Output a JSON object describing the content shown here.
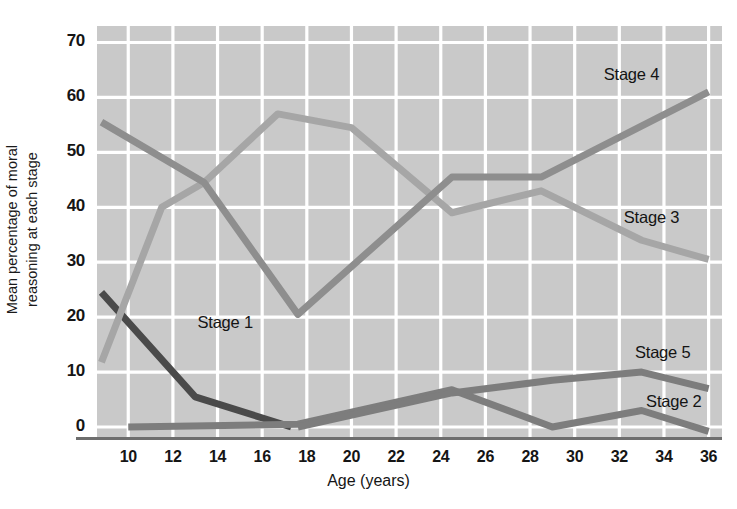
{
  "chart_data": {
    "type": "line",
    "title": "",
    "xlabel": "Age (years)",
    "ylabel": "Mean percentage of moral reasoning at each stage",
    "ylabel_line1": "Mean percentage of moral",
    "ylabel_line2": "reasoning at each stage",
    "xlim": [
      8.6,
      36.6
    ],
    "ylim": [
      -2,
      73
    ],
    "xticks": [
      10,
      12,
      14,
      16,
      18,
      20,
      22,
      24,
      26,
      28,
      30,
      32,
      34,
      36
    ],
    "yticks": [
      0,
      10,
      20,
      30,
      40,
      50,
      60,
      70
    ],
    "grid": true,
    "grid_color": "#ffffff",
    "plot_background": "#c9c9c9",
    "legend_position": "inline-right",
    "series": [
      {
        "name": "Stage 1",
        "color": "#4a4a4a",
        "label_x": 13.1,
        "label_y": 19.0,
        "x": [
          8.8,
          13.0,
          17.3
        ],
        "values": [
          24.5,
          5.5,
          0.0
        ]
      },
      {
        "name": "Stage 2",
        "color": "#7d7d7d",
        "label_x": 33.2,
        "label_y": 4.5,
        "x": [
          10.0,
          17.6,
          24.5,
          29.0,
          33.0,
          36.0
        ],
        "values": [
          0.0,
          0.5,
          6.8,
          0.0,
          3.0,
          -0.8
        ]
      },
      {
        "name": "Stage 3",
        "color": "#a6a6a6",
        "label_x": 32.2,
        "label_y": 38.0,
        "x": [
          8.8,
          11.5,
          13.4,
          16.7,
          20.0,
          24.5,
          28.5,
          33.0,
          36.0
        ],
        "values": [
          11.8,
          40.0,
          44.5,
          57.0,
          54.5,
          39.0,
          43.0,
          34.0,
          30.5
        ]
      },
      {
        "name": "Stage 4",
        "color": "#8e8e8e",
        "label_x": 31.3,
        "label_y": 64.0,
        "x": [
          8.8,
          13.4,
          17.6,
          24.5,
          28.5,
          36.0
        ],
        "values": [
          55.5,
          44.5,
          20.5,
          45.5,
          45.5,
          61.0
        ]
      },
      {
        "name": "Stage 5",
        "color": "#7d7d7d",
        "label_x": 32.7,
        "label_y": 13.5,
        "x": [
          17.6,
          24.5,
          29.0,
          33.0,
          36.0
        ],
        "values": [
          0.0,
          6.2,
          8.5,
          10.0,
          7.0
        ]
      }
    ]
  }
}
